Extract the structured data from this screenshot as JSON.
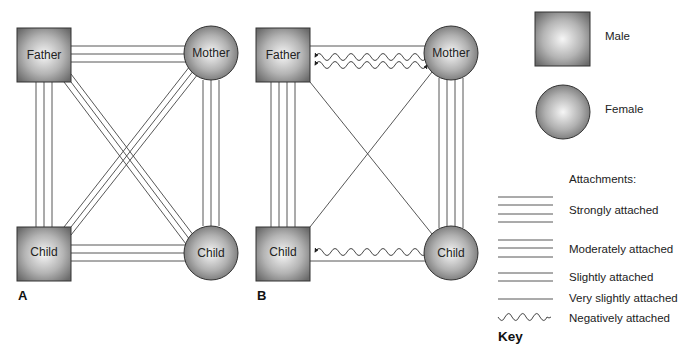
{
  "panels": [
    {
      "id": "A",
      "label": "A",
      "nodes": {
        "father": {
          "label": "Father",
          "shape": "square",
          "sex": "male"
        },
        "mother": {
          "label": "Mother",
          "shape": "circle",
          "sex": "female"
        },
        "son": {
          "label": "Child",
          "shape": "square",
          "sex": "male"
        },
        "daughter": {
          "label": "Child",
          "shape": "circle",
          "sex": "female"
        }
      },
      "attachments": [
        {
          "from": "Father",
          "to": "Mother",
          "lines": 3,
          "type": "Moderately attached"
        },
        {
          "from": "Father",
          "to": "Child (male)",
          "lines": 3,
          "type": "Moderately attached"
        },
        {
          "from": "Mother",
          "to": "Child (female)",
          "lines": 3,
          "type": "Moderately attached"
        },
        {
          "from": "Child (male)",
          "to": "Child (female)",
          "lines": 3,
          "type": "Moderately attached"
        },
        {
          "from": "Father",
          "to": "Child (female)",
          "lines": 3,
          "type": "Moderately attached"
        },
        {
          "from": "Mother",
          "to": "Child (male)",
          "lines": 3,
          "type": "Moderately attached"
        }
      ]
    },
    {
      "id": "B",
      "label": "B",
      "nodes": {
        "father": {
          "label": "Father",
          "shape": "square",
          "sex": "male"
        },
        "mother": {
          "label": "Mother",
          "shape": "circle",
          "sex": "female"
        },
        "son": {
          "label": "Child",
          "shape": "square",
          "sex": "male"
        },
        "daughter": {
          "label": "Child",
          "shape": "circle",
          "sex": "female"
        }
      },
      "attachments": [
        {
          "from": "Father",
          "to": "Mother",
          "lines": 1,
          "type": "Very slightly attached"
        },
        {
          "from": "Father",
          "to": "Mother",
          "waves": 2,
          "type": "Negatively attached"
        },
        {
          "from": "Father",
          "to": "Child (male)",
          "lines": 4,
          "type": "Strongly attached"
        },
        {
          "from": "Mother",
          "to": "Child (female)",
          "lines": 4,
          "type": "Strongly attached"
        },
        {
          "from": "Child (male)",
          "to": "Child (female)",
          "lines": 1,
          "type": "Very slightly attached"
        },
        {
          "from": "Child (male)",
          "to": "Child (female)",
          "waves": 1,
          "type": "Negatively attached"
        },
        {
          "from": "Father",
          "to": "Child (female)",
          "lines": 1,
          "type": "Very slightly attached"
        },
        {
          "from": "Mother",
          "to": "Child (male)",
          "lines": 1,
          "type": "Very slightly attached"
        }
      ]
    }
  ],
  "legend": {
    "male_label": "Male",
    "female_label": "Female",
    "attachments_title": "Attachments:",
    "items": [
      {
        "label": "Strongly attached",
        "lines": 4
      },
      {
        "label": "Moderately attached",
        "lines": 3
      },
      {
        "label": "Slightly attached",
        "lines": 2
      },
      {
        "label": "Very slightly attached",
        "lines": 1
      },
      {
        "label": "Negatively attached",
        "lines": 0,
        "wavy": true
      }
    ],
    "key_label": "Key"
  },
  "colors": {
    "line": "#444444",
    "shape_dark": "#6e6e6e",
    "shape_light": "#f4f4f4",
    "shape_border": "#333333"
  }
}
